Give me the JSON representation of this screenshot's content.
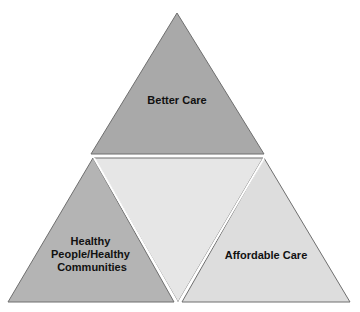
{
  "diagram": {
    "type": "triple-aim-triangle",
    "segments": {
      "top": {
        "label": "Better Care",
        "color": "#a9a9a9"
      },
      "left": {
        "label_lines": [
          "Healthy",
          "People/Healthy",
          "Communities"
        ],
        "color": "#b4b4b4"
      },
      "right": {
        "label": "Affordable Care",
        "color": "#dddddd"
      },
      "center": {
        "label": "",
        "color": "#e6e6e6"
      }
    },
    "stroke_color": "#6f6f6f"
  }
}
